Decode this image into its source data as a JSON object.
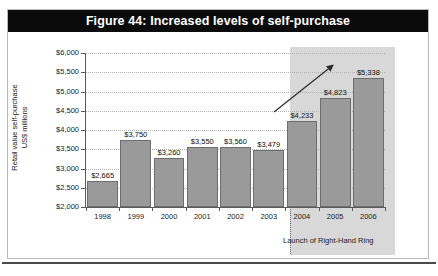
{
  "figure": {
    "title": "Figure 44: Increased levels of self-purchase"
  },
  "chart_data": {
    "type": "bar",
    "title": "Figure 44: Increased levels of self-purchase",
    "xlabel": "",
    "ylabel": "Retail value self-purchase US$ millions",
    "ylabel_line1": "Retail value self-purchase",
    "ylabel_line2": "US$ millions",
    "categories": [
      "1998",
      "1999",
      "2000",
      "2001",
      "2002",
      "2003",
      "2004",
      "2005",
      "2006"
    ],
    "values": [
      2665,
      3750,
      3260,
      3550,
      3560,
      3479,
      4233,
      4823,
      5338
    ],
    "value_labels": [
      "$2,665",
      "$3,750",
      "$3,260",
      "$3,550",
      "$3,560",
      "$3,479",
      "$4,233",
      "$4,823",
      "$5,338"
    ],
    "ylim": [
      2000,
      6000
    ],
    "ytick_values": [
      2000,
      2500,
      3000,
      3500,
      4000,
      4500,
      5000,
      5500,
      6000
    ],
    "ytick_labels": [
      "$2,000",
      "$2,500",
      "$3,000",
      "$3,500",
      "$4,000",
      "$4,500",
      "$5,000",
      "$5,500",
      "$6,000"
    ],
    "grid": true,
    "legend": "none",
    "annotations": [
      {
        "name": "launch-annotation",
        "text": "Launch of Right-Hand Ring",
        "at_category": "2004"
      },
      {
        "name": "growth-arrow",
        "text": "",
        "direction": "up-right"
      }
    ],
    "shaded_region": {
      "from_category": "2004",
      "to_category": "2006",
      "color": "#d8d8d8"
    },
    "colors": {
      "bar_fill": "#9a9a9a",
      "bar_edge": "#6e6e6e",
      "title_bar": "#0b0b0b",
      "title_text": "#ffffff",
      "grid": "#b0b0b0",
      "axis": "#5a5a5a"
    }
  }
}
